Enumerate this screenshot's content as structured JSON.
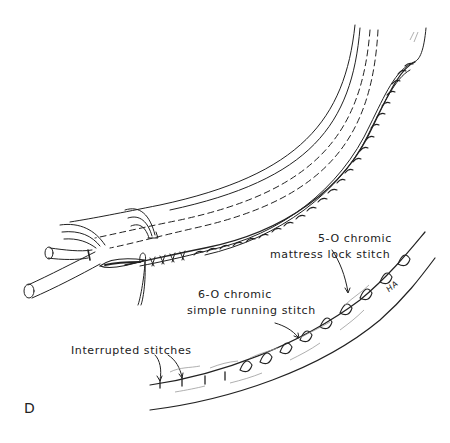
{
  "figure": {
    "panel_letter": "D",
    "signature": "HA",
    "labels": {
      "mattress_line1": "5-O chromic",
      "mattress_line2": "mattress lock stitch",
      "running_line1": "6-O chromic",
      "running_line2": "simple running stitch",
      "interrupted": "Interrupted stitches"
    },
    "colors": {
      "ink": "#222222",
      "shade": "#9a9a9a",
      "background": "#ffffff"
    }
  }
}
